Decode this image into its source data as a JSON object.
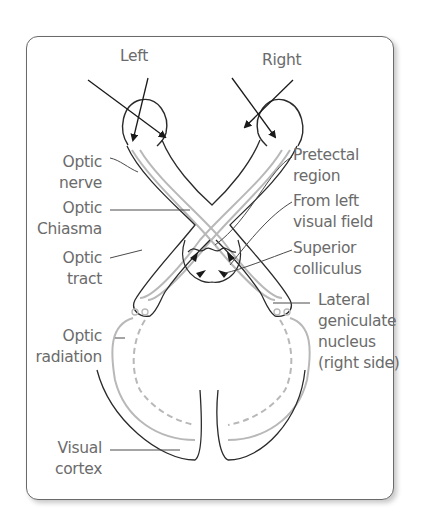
{
  "diagram": {
    "labels": {
      "left": "Left",
      "right": "Right",
      "optic_nerve": [
        "Optic",
        "nerve"
      ],
      "optic_chiasma": [
        "Optic",
        "Chiasma"
      ],
      "optic_tract": [
        "Optic",
        "tract"
      ],
      "optic_radiation": [
        "Optic",
        "radiation"
      ],
      "visual_cortex": [
        "Visual",
        "cortex"
      ],
      "pretectal_region": [
        "Pretectal",
        "region"
      ],
      "from_left_visual_field": [
        "From left",
        "visual field"
      ],
      "superior_colliculus": [
        "Superior",
        "colliculus"
      ],
      "lateral_geniculate_nucleus": [
        "Lateral",
        "geniculate",
        "nucleus",
        "(right side)"
      ]
    },
    "colors": {
      "outline": "#2a2a2a",
      "fiber": "#b8b8b8",
      "label_text": "#6b6b6b",
      "leader_line": "#4a4a4a",
      "frame_border": "#6a6a6a"
    }
  }
}
